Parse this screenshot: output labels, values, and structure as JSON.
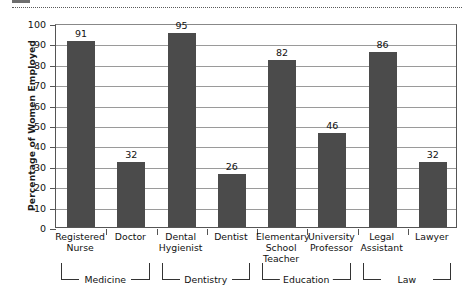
{
  "chart_data": {
    "type": "bar",
    "title": "",
    "xlabel": "",
    "ylabel": "Percentage of Women Employed",
    "ylim": [
      0,
      100
    ],
    "ytick_step": 10,
    "yticks": [
      "100",
      "90",
      "80",
      "70",
      "60",
      "50",
      "40",
      "30",
      "20",
      "10",
      "0"
    ],
    "grid": true,
    "legend": "none",
    "bar_color": "#4b4b4b",
    "categories": [
      "Registered Nurse",
      "Doctor",
      "Dental Hygienist",
      "Dentist",
      "Elementary School Teacher",
      "University Professor",
      "Legal Assistant",
      "Lawyer"
    ],
    "category_lines": [
      [
        "Registered",
        "Nurse"
      ],
      [
        "Doctor"
      ],
      [
        "Dental",
        "Hygienist"
      ],
      [
        "Dentist"
      ],
      [
        "Elementary",
        "School",
        "Teacher"
      ],
      [
        "University",
        "Professor"
      ],
      [
        "Legal",
        "Assistant"
      ],
      [
        "Lawyer"
      ]
    ],
    "values": [
      91,
      32,
      95,
      26,
      82,
      46,
      86,
      32
    ],
    "value_labels": [
      "91",
      "32",
      "95",
      "26",
      "82",
      "46",
      "86",
      "32"
    ],
    "groups": [
      {
        "label": "Medicine",
        "start": 0,
        "end": 1
      },
      {
        "label": "Dentistry",
        "start": 2,
        "end": 3
      },
      {
        "label": "Education",
        "start": 4,
        "end": 5
      },
      {
        "label": "Law",
        "start": 6,
        "end": 7
      }
    ]
  },
  "figure": {
    "tear_line": "dotted-cut-line"
  }
}
